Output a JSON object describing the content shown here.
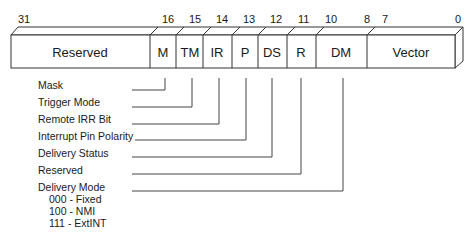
{
  "diagram": {
    "bit_numbers": [
      {
        "text": "31",
        "x": 24
      },
      {
        "text": "16",
        "x": 168
      },
      {
        "text": "15",
        "x": 195
      },
      {
        "text": "14",
        "x": 222
      },
      {
        "text": "13",
        "x": 249
      },
      {
        "text": "12",
        "x": 275
      },
      {
        "text": "11",
        "x": 304
      },
      {
        "text": "10",
        "x": 331
      },
      {
        "text": "8",
        "x": 364
      },
      {
        "text": "7",
        "x": 382
      },
      {
        "text": "0",
        "x": 456
      }
    ],
    "fields": [
      {
        "abbr": "Reserved",
        "bits": "31-16"
      },
      {
        "abbr": "M",
        "bits": "16"
      },
      {
        "abbr": "TM",
        "bits": "15"
      },
      {
        "abbr": "IR",
        "bits": "14"
      },
      {
        "abbr": "P",
        "bits": "13"
      },
      {
        "abbr": "DS",
        "bits": "12"
      },
      {
        "abbr": "R",
        "bits": "11"
      },
      {
        "abbr": "DM",
        "bits": "10-8"
      },
      {
        "abbr": "Vector",
        "bits": "7-0"
      }
    ],
    "legend": [
      {
        "label": "Mask",
        "field": "M"
      },
      {
        "label": "Trigger Mode",
        "field": "TM"
      },
      {
        "label": "Remote IRR Bit",
        "field": "IR"
      },
      {
        "label": "Interrupt Pin Polarity",
        "field": "P"
      },
      {
        "label": "Delivery Status",
        "field": "DS"
      },
      {
        "label": "Reserved",
        "field": "R"
      },
      {
        "label": "Delivery Mode",
        "field": "DM"
      }
    ],
    "delivery_modes": [
      "000 - Fixed",
      "100 - NMI",
      "111 - ExtINT"
    ]
  }
}
